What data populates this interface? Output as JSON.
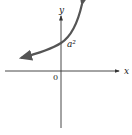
{
  "diagram": {
    "type": "function-graph",
    "axes": {
      "x_label": "x",
      "y_label": "y",
      "origin_label": "0"
    },
    "curve": {
      "description": "exponential growth curve with arrows on both ends",
      "y_intercept_label": "a²"
    },
    "colors": {
      "axis": "#333333",
      "curve": "#555555",
      "background": "#ffffff"
    }
  }
}
